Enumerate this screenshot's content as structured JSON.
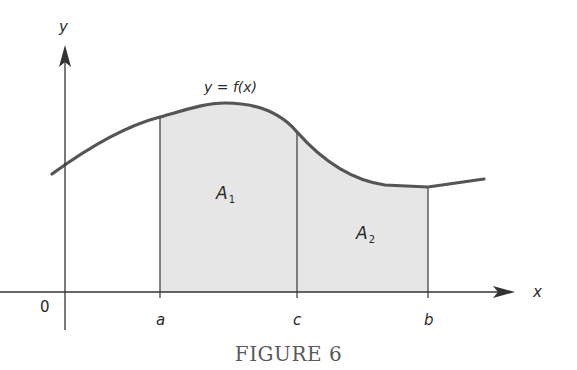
{
  "figure": {
    "caption": "FIGURE 6",
    "curve_label": "y = f(x)",
    "axes": {
      "x_label": "x",
      "y_label": "y",
      "origin_label": "0"
    },
    "ticks": [
      {
        "label": "a"
      },
      {
        "label": "c"
      },
      {
        "label": "b"
      }
    ],
    "regions": [
      {
        "label": "A",
        "subscript": "1"
      },
      {
        "label": "A",
        "subscript": "2"
      }
    ],
    "colors": {
      "curve": "#555555",
      "shade": "#e6e6e6",
      "axis": "#333333"
    }
  }
}
